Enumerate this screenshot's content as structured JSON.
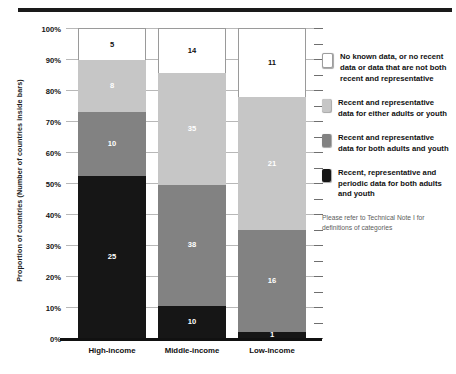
{
  "figure": {
    "cut_title": "",
    "ylabel": "Proportion of countries (Number of countries inside bars)"
  },
  "legend": {
    "items": [
      {
        "key": "no-data",
        "swatch": "white",
        "label": "No known data, or no recent data or data that are not both recent and representative"
      },
      {
        "key": "either",
        "swatch": "light",
        "label": "Recent and representative data for either adults or youth"
      },
      {
        "key": "both",
        "swatch": "dark",
        "label": "Recent and representative data for both adults and youth"
      },
      {
        "key": "periodic",
        "swatch": "black",
        "label": "Recent, representative and periodic data for both adults and youth"
      }
    ],
    "footnote": "Please refer to Technical Note I for definitions of categories"
  },
  "chart_data": {
    "type": "bar",
    "stacked": true,
    "normalized": true,
    "title": "",
    "xlabel": "",
    "ylabel": "Proportion of countries (Number of countries inside bars)",
    "ylim": [
      0,
      100
    ],
    "ytick_labels": [
      "100%",
      "90%",
      "80%",
      "70%",
      "60%",
      "50%",
      "40%",
      "30%",
      "20%",
      "10%",
      "0%"
    ],
    "ytick_values": [
      100,
      90,
      80,
      70,
      60,
      50,
      40,
      30,
      20,
      10,
      0
    ],
    "grid": true,
    "legend_position": "right",
    "categories": [
      "High-income",
      "Middle-income",
      "Low-income"
    ],
    "series": [
      {
        "name": "Recent, representative and periodic data for both adults and youth",
        "color": "#161616",
        "values": [
          25,
          10,
          1
        ],
        "percent": [
          52.1,
          10.3,
          2.0
        ]
      },
      {
        "name": "Recent and representative data for both adults and youth",
        "color": "#828282",
        "values": [
          10,
          38,
          16
        ],
        "percent": [
          20.8,
          39.2,
          32.7
        ]
      },
      {
        "name": "Recent and representative data for either adults or youth",
        "color": "#c6c6c6",
        "values": [
          8,
          35,
          21
        ],
        "percent": [
          16.7,
          36.1,
          42.9
        ]
      },
      {
        "name": "No known data, or no recent data or data that are not both recent and representative",
        "color": "#ffffff",
        "values": [
          5,
          14,
          11
        ],
        "percent": [
          10.4,
          14.4,
          22.4
        ]
      }
    ],
    "totals": [
      48,
      97,
      49
    ]
  }
}
